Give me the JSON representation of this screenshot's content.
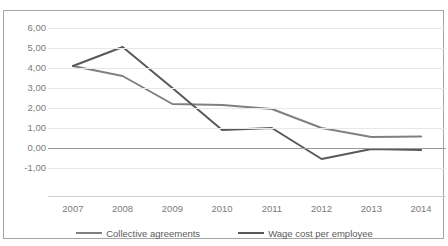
{
  "title": "",
  "legend": {
    "position": "bottom",
    "items": [
      {
        "label": "Collective agreements",
        "color": "#808080",
        "key": "collective-agreements"
      },
      {
        "label": "Wage cost per employee",
        "color": "#595959",
        "key": "wage-cost-per-employee"
      }
    ]
  },
  "axes": {
    "y_ticks": [
      "6,00",
      "5,00",
      "4,00",
      "3,00",
      "2,00",
      "1,00",
      "0,00",
      "-1,00"
    ],
    "x_ticks": [
      "2007",
      "2008",
      "2009",
      "2010",
      "2011",
      "2012",
      "2013",
      "2014"
    ]
  },
  "colors": {
    "collective_agreements": "#808080",
    "wage_cost": "#595959",
    "gridline": "#e8e8e8",
    "zero_line": "#9a9a9a",
    "border": "#a6a6a6",
    "tick_text": "#7b7b7b",
    "legend_text": "#5a5a5a"
  },
  "chart_data": {
    "type": "line",
    "title": "",
    "xlabel": "",
    "ylabel": "",
    "categories": [
      "2007",
      "2008",
      "2009",
      "2010",
      "2011",
      "2012",
      "2013",
      "2014"
    ],
    "ylim": [
      -1.0,
      6.0
    ],
    "ytick_step": 1.0,
    "grid": true,
    "legend_position": "bottom",
    "series": [
      {
        "name": "Collective agreements",
        "color": "#808080",
        "values": [
          4.1,
          3.6,
          2.2,
          2.15,
          1.95,
          1.0,
          0.55,
          0.58
        ]
      },
      {
        "name": "Wage cost per employee",
        "color": "#595959",
        "values": [
          4.1,
          5.05,
          3.0,
          0.9,
          1.0,
          -0.55,
          -0.05,
          -0.1
        ]
      }
    ]
  }
}
